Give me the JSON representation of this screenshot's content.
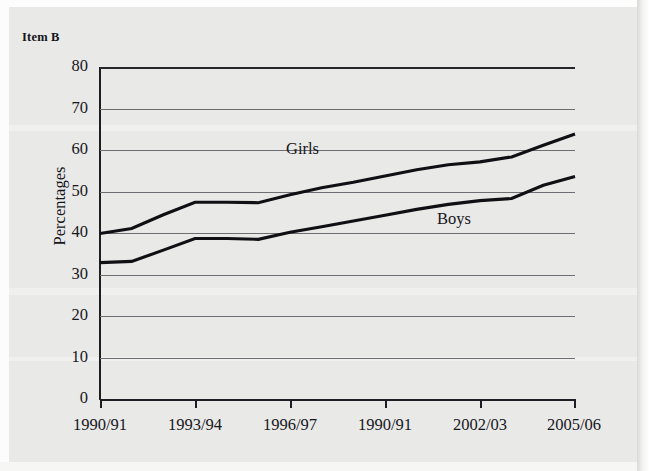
{
  "chart_data": {
    "type": "line",
    "title": "Item B",
    "xlabel": "",
    "ylabel": "Percentages",
    "ylim": [
      0,
      80
    ],
    "ytick_values": [
      80,
      70,
      60,
      50,
      40,
      30,
      20,
      10,
      0
    ],
    "grid": true,
    "legend": "inline-labels",
    "categories": [
      "1990/91",
      "1991/92",
      "1992/93",
      "1993/94",
      "1994/95",
      "1995/96",
      "1996/97",
      "1997/98",
      "1998/99",
      "1990/91",
      "2000/01",
      "2001/02",
      "2002/03",
      "2003/04",
      "2004/05",
      "2005/06"
    ],
    "xtick_labels": [
      "1990/91",
      "1993/94",
      "1996/97",
      "1990/91",
      "2002/03",
      "2005/06"
    ],
    "series": [
      {
        "name": "Girls",
        "values": [
          40.0,
          41.2,
          44.5,
          47.5,
          47.5,
          47.4,
          49.3,
          51.0,
          52.3,
          53.8,
          55.3,
          56.5,
          57.2,
          58.4,
          61.2,
          63.9
        ]
      },
      {
        "name": "Boys",
        "values": [
          33.0,
          33.3,
          36.0,
          38.8,
          38.8,
          38.6,
          40.3,
          41.6,
          43.0,
          44.4,
          45.8,
          47.0,
          47.9,
          48.4,
          51.6,
          53.7
        ]
      }
    ],
    "annotations": [
      {
        "text": "Girls",
        "x_label": "1996/97",
        "value": 53
      },
      {
        "text": "Boys",
        "x_label": "1990/91",
        "value": 45
      }
    ]
  },
  "axis": {
    "y_labels": [
      "80",
      "70",
      "60",
      "50",
      "40",
      "30",
      "20",
      "10",
      "0"
    ],
    "y_title": "Percentages",
    "x_labels": [
      "1990/91",
      "1993/94",
      "1996/97",
      "1990/91",
      "2002/03",
      "2005/06"
    ]
  },
  "header": {
    "title": "Item B"
  },
  "series_labels": {
    "girls": "Girls",
    "boys": "Boys"
  },
  "colors": {
    "background": "#e9e9e7",
    "line": "#101014",
    "gridline": "#6e6e72",
    "axis": "#1d1d22",
    "text": "#16161c"
  }
}
